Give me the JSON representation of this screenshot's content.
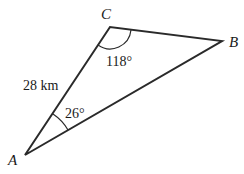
{
  "diagram": {
    "type": "triangle",
    "vertices": [
      {
        "label": "A",
        "x": 25,
        "y": 155
      },
      {
        "label": "B",
        "x": 222,
        "y": 41
      },
      {
        "label": "C",
        "x": 110,
        "y": 27
      }
    ],
    "side_labels": {
      "AC": "28 km"
    },
    "angle_labels": {
      "C": "118°",
      "A": "26°"
    },
    "stroke_color": "#2a2a2a"
  }
}
